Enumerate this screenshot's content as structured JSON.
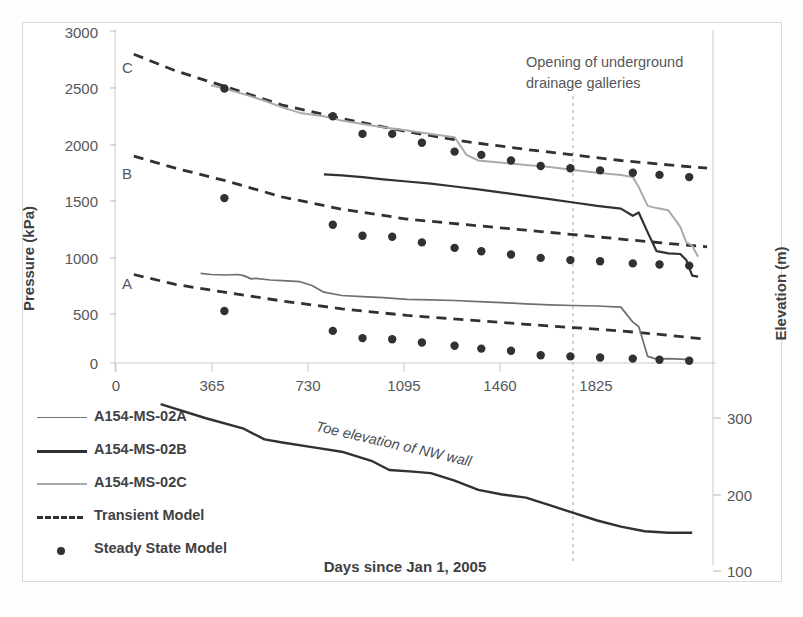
{
  "chart_data": {
    "type": "line",
    "title": "",
    "xlabel": "Days since Jan 1, 2005",
    "ylabel": "Pressure (kPa)",
    "y2label": "Elevation (m)",
    "xlim": [
      0,
      2010
    ],
    "ylim": [
      0,
      3000
    ],
    "y2lim": [
      70,
      330
    ],
    "grid": false,
    "xticks": [
      0,
      365,
      730,
      1095,
      1460,
      1825
    ],
    "yticks": [
      0,
      500,
      1000,
      1500,
      2000,
      2500,
      3000
    ],
    "y2ticks": [
      100,
      200,
      300
    ],
    "legend_position": "lower-left-outside",
    "annotations": [
      {
        "text": "Opening of underground drainage galleries",
        "x": 1740,
        "kind": "vertical-dashed-line"
      },
      {
        "text": "Toe elevation of NW wall",
        "kind": "inline-curve-label"
      },
      {
        "text": "C",
        "kind": "series-tag",
        "x": 90,
        "y": 2720
      },
      {
        "text": "B",
        "kind": "series-tag",
        "x": 90,
        "y": 1790
      },
      {
        "text": "A",
        "kind": "series-tag",
        "x": 90,
        "y": 760
      }
    ],
    "series": [
      {
        "name": "A154-MS-02A",
        "style": "solid-thin-grey",
        "color": "#6d6f72",
        "points": [
          [
            285,
            810
          ],
          [
            320,
            800
          ],
          [
            370,
            795
          ],
          [
            410,
            800
          ],
          [
            430,
            790
          ],
          [
            455,
            760
          ],
          [
            470,
            765
          ],
          [
            520,
            750
          ],
          [
            560,
            745
          ],
          [
            590,
            740
          ],
          [
            620,
            735
          ],
          [
            660,
            700
          ],
          [
            700,
            640
          ],
          [
            760,
            610
          ],
          [
            830,
            600
          ],
          [
            900,
            590
          ],
          [
            980,
            575
          ],
          [
            1060,
            570
          ],
          [
            1140,
            565
          ],
          [
            1220,
            555
          ],
          [
            1300,
            545
          ],
          [
            1380,
            535
          ],
          [
            1460,
            525
          ],
          [
            1540,
            520
          ],
          [
            1620,
            515
          ],
          [
            1700,
            505
          ],
          [
            1740,
            370
          ],
          [
            1760,
            330
          ],
          [
            1790,
            60
          ],
          [
            1820,
            35
          ],
          [
            1860,
            40
          ],
          [
            1900,
            35
          ],
          [
            1940,
            30
          ]
        ]
      },
      {
        "name": "A154-MS-02B",
        "style": "solid-thick-dark",
        "color": "#2f3134",
        "points": [
          [
            700,
            1705
          ],
          [
            760,
            1695
          ],
          [
            830,
            1680
          ],
          [
            900,
            1660
          ],
          [
            980,
            1640
          ],
          [
            1060,
            1620
          ],
          [
            1140,
            1595
          ],
          [
            1220,
            1570
          ],
          [
            1300,
            1540
          ],
          [
            1380,
            1510
          ],
          [
            1460,
            1480
          ],
          [
            1540,
            1450
          ],
          [
            1620,
            1420
          ],
          [
            1700,
            1395
          ],
          [
            1740,
            1330
          ],
          [
            1760,
            1360
          ],
          [
            1790,
            1180
          ],
          [
            1820,
            1010
          ],
          [
            1860,
            990
          ],
          [
            1900,
            985
          ],
          [
            1920,
            930
          ],
          [
            1940,
            790
          ],
          [
            1960,
            780
          ]
        ]
      },
      {
        "name": "A154-MS-02C",
        "style": "solid-light-grey",
        "color": "#a8abae",
        "points": [
          [
            320,
            2510
          ],
          [
            365,
            2480
          ],
          [
            430,
            2430
          ],
          [
            500,
            2370
          ],
          [
            560,
            2310
          ],
          [
            620,
            2260
          ],
          [
            700,
            2230
          ],
          [
            760,
            2190
          ],
          [
            830,
            2160
          ],
          [
            900,
            2130
          ],
          [
            980,
            2100
          ],
          [
            1060,
            2070
          ],
          [
            1140,
            2040
          ],
          [
            1180,
            1880
          ],
          [
            1220,
            1830
          ],
          [
            1300,
            1810
          ],
          [
            1380,
            1790
          ],
          [
            1460,
            1770
          ],
          [
            1540,
            1745
          ],
          [
            1620,
            1720
          ],
          [
            1700,
            1700
          ],
          [
            1740,
            1680
          ],
          [
            1760,
            1590
          ],
          [
            1790,
            1420
          ],
          [
            1820,
            1400
          ],
          [
            1860,
            1380
          ],
          [
            1900,
            1230
          ],
          [
            1920,
            1090
          ],
          [
            1940,
            1060
          ],
          [
            1960,
            960
          ]
        ]
      }
    ],
    "transient_model": [
      {
        "for": "C",
        "points": [
          [
            60,
            2790
          ],
          [
            200,
            2640
          ],
          [
            365,
            2500
          ],
          [
            560,
            2330
          ],
          [
            760,
            2210
          ],
          [
            980,
            2090
          ],
          [
            1180,
            2000
          ],
          [
            1380,
            1930
          ],
          [
            1540,
            1880
          ],
          [
            1700,
            1830
          ],
          [
            1860,
            1790
          ],
          [
            1990,
            1760
          ]
        ]
      },
      {
        "for": "B",
        "points": [
          [
            60,
            1870
          ],
          [
            200,
            1760
          ],
          [
            365,
            1650
          ],
          [
            560,
            1500
          ],
          [
            760,
            1390
          ],
          [
            980,
            1300
          ],
          [
            1180,
            1250
          ],
          [
            1380,
            1200
          ],
          [
            1540,
            1160
          ],
          [
            1700,
            1120
          ],
          [
            1860,
            1080
          ],
          [
            1990,
            1050
          ]
        ]
      },
      {
        "for": "A",
        "points": [
          [
            60,
            800
          ],
          [
            200,
            710
          ],
          [
            365,
            640
          ],
          [
            560,
            560
          ],
          [
            760,
            490
          ],
          [
            980,
            430
          ],
          [
            1180,
            390
          ],
          [
            1380,
            350
          ],
          [
            1540,
            320
          ],
          [
            1700,
            290
          ],
          [
            1860,
            250
          ],
          [
            1990,
            215
          ]
        ]
      }
    ],
    "steady_state_model": [
      {
        "for": "C",
        "points": [
          [
            365,
            2480
          ],
          [
            730,
            2230
          ],
          [
            830,
            2070
          ],
          [
            930,
            2070
          ],
          [
            1030,
            1990
          ],
          [
            1140,
            1910
          ],
          [
            1230,
            1880
          ],
          [
            1330,
            1830
          ],
          [
            1430,
            1780
          ],
          [
            1530,
            1760
          ],
          [
            1630,
            1740
          ],
          [
            1740,
            1720
          ],
          [
            1830,
            1700
          ],
          [
            1930,
            1680
          ]
        ]
      },
      {
        "for": "B",
        "points": [
          [
            365,
            1490
          ],
          [
            730,
            1250
          ],
          [
            830,
            1150
          ],
          [
            930,
            1140
          ],
          [
            1030,
            1090
          ],
          [
            1140,
            1040
          ],
          [
            1230,
            1010
          ],
          [
            1330,
            980
          ],
          [
            1430,
            950
          ],
          [
            1530,
            930
          ],
          [
            1630,
            920
          ],
          [
            1740,
            900
          ],
          [
            1830,
            890
          ],
          [
            1930,
            880
          ]
        ]
      },
      {
        "for": "A",
        "points": [
          [
            365,
            470
          ],
          [
            730,
            290
          ],
          [
            830,
            225
          ],
          [
            930,
            215
          ],
          [
            1030,
            185
          ],
          [
            1140,
            155
          ],
          [
            1230,
            130
          ],
          [
            1330,
            110
          ],
          [
            1430,
            70
          ],
          [
            1530,
            60
          ],
          [
            1630,
            50
          ],
          [
            1740,
            40
          ],
          [
            1830,
            30
          ],
          [
            1930,
            20
          ]
        ]
      }
    ],
    "toe_elevation": {
      "name": "Toe elevation of NW wall",
      "axis": "right",
      "color": "#2f3134",
      "points": [
        [
          150,
          318
        ],
        [
          300,
          300
        ],
        [
          430,
          286
        ],
        [
          500,
          272
        ],
        [
          560,
          268
        ],
        [
          660,
          262
        ],
        [
          760,
          256
        ],
        [
          860,
          244
        ],
        [
          920,
          232
        ],
        [
          1000,
          230
        ],
        [
          1060,
          228
        ],
        [
          1140,
          218
        ],
        [
          1220,
          206
        ],
        [
          1300,
          200
        ],
        [
          1380,
          196
        ],
        [
          1460,
          186
        ],
        [
          1540,
          176
        ],
        [
          1620,
          166
        ],
        [
          1700,
          158
        ],
        [
          1780,
          152
        ],
        [
          1860,
          150
        ],
        [
          1940,
          150
        ]
      ]
    }
  },
  "axes": {
    "y_title": "Pressure (kPa)",
    "y2_title": "Elevation (m)",
    "x_title": "Days since Jan 1, 2005",
    "y_ticks": [
      "3000",
      "2500",
      "2000",
      "1500",
      "1000",
      "500",
      "0"
    ],
    "x_ticks": [
      "0",
      "365",
      "730",
      "1095",
      "1460",
      "1825"
    ],
    "y2_ticks": [
      "300",
      "200",
      "100"
    ]
  },
  "series_tags": {
    "c": "C",
    "b": "B",
    "a": "A"
  },
  "annotation": {
    "drainage_line1": "Opening of underground",
    "drainage_line2": "drainage galleries",
    "toe": "Toe elevation of NW wall"
  },
  "legend": {
    "items": [
      {
        "label": "A154-MS-02A",
        "key": "line-thin-grey"
      },
      {
        "label": "A154-MS-02B",
        "key": "line-thick-dark"
      },
      {
        "label": "A154-MS-02C",
        "key": "line-light-grey"
      },
      {
        "label": "Transient Model",
        "key": "line-dashed"
      },
      {
        "label": "Steady State Model",
        "key": "dot-marker"
      }
    ]
  },
  "colors": {
    "series_a": "#6d6f72",
    "series_b": "#2f3134",
    "series_c": "#a8abae",
    "model": "#2f3134",
    "text": "#55575a",
    "frame": "#d8d8d8"
  }
}
